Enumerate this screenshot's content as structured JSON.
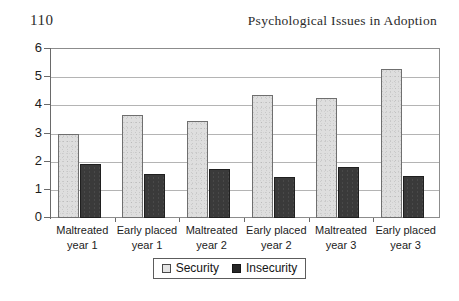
{
  "page": {
    "number": "110",
    "running_head": "Psychological Issues in Adoption"
  },
  "legend": {
    "security_label": "Security",
    "insecurity_label": "Insecurity"
  },
  "chart_data": {
    "type": "bar",
    "title": "",
    "xlabel": "",
    "ylabel": "",
    "ylim": [
      0,
      6
    ],
    "yticks": [
      0,
      1,
      2,
      3,
      4,
      5,
      6
    ],
    "grid": true,
    "legend_position": "bottom",
    "categories": [
      "Maltreated year 1",
      "Early placed year 1",
      "Maltreated year 2",
      "Early placed year 2",
      "Maltreated year 3",
      "Early placed year 3"
    ],
    "category_lines": [
      [
        "Maltreated",
        "year 1"
      ],
      [
        "Early placed",
        "year 1"
      ],
      [
        "Maltreated",
        "year 2"
      ],
      [
        "Early placed",
        "year 2"
      ],
      [
        "Maltreated",
        "year 3"
      ],
      [
        "Early placed",
        "year 3"
      ]
    ],
    "series": [
      {
        "name": "Security",
        "color": "#dedede",
        "values": [
          3.0,
          3.65,
          3.45,
          4.35,
          4.25,
          5.3
        ]
      },
      {
        "name": "Insecurity",
        "color": "#3a3a3a",
        "values": [
          1.9,
          1.55,
          1.75,
          1.45,
          1.8,
          1.5
        ]
      }
    ]
  }
}
